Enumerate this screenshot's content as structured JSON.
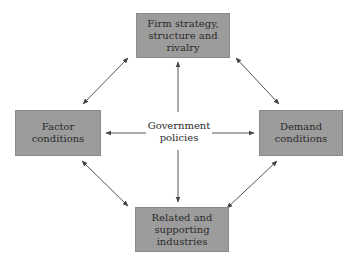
{
  "diagram": {
    "type": "porter-diamond",
    "nodes": {
      "top": "Firm strategy,\nstructure and\nrivalry",
      "left": "Factor\nconditions",
      "right": "Demand\nconditions",
      "bottom": "Related and\nsupporting\nindustries",
      "center": "Government\npolicies"
    },
    "edges": [
      {
        "from": "top",
        "to": "left",
        "style": "double-arrow"
      },
      {
        "from": "top",
        "to": "right",
        "style": "double-arrow"
      },
      {
        "from": "bottom",
        "to": "left",
        "style": "double-arrow"
      },
      {
        "from": "bottom",
        "to": "right",
        "style": "double-arrow"
      },
      {
        "from": "center",
        "to": "top",
        "style": "arrow"
      },
      {
        "from": "center",
        "to": "left",
        "style": "arrow"
      },
      {
        "from": "center",
        "to": "right",
        "style": "arrow"
      },
      {
        "from": "center",
        "to": "bottom",
        "style": "arrow"
      }
    ],
    "colors": {
      "box_fill": "#9c9c9c",
      "arrow": "#444444",
      "text": "#2a2a2a"
    }
  }
}
